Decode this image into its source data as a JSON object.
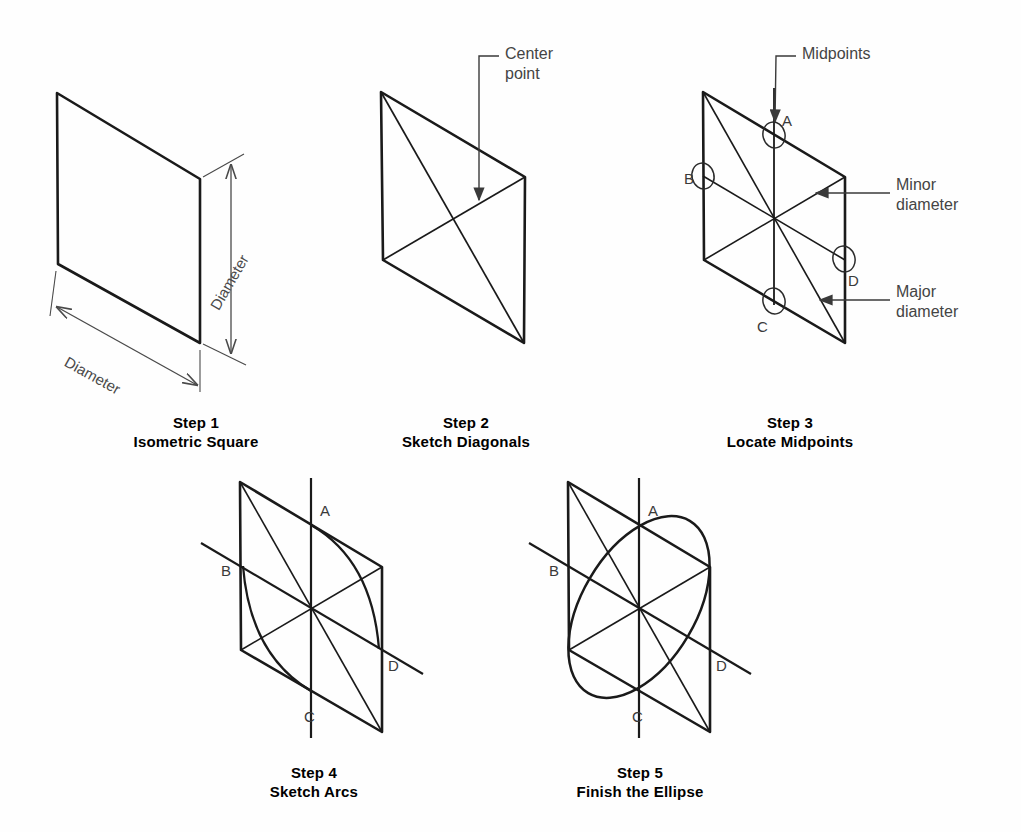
{
  "figure": {
    "background_color": "#fefefe",
    "ink_color": "#1a1a1a",
    "annotation_color": "#444444"
  },
  "steps": [
    {
      "id": "step-1",
      "number_label": "Step 1",
      "title": "Isometric Square",
      "caption_x": 196,
      "caption_y": 413,
      "rhombus": {
        "top_x": 57,
        "top_y": 93,
        "right_x": 200,
        "right_y": 179,
        "bottom_x": 200,
        "bottom_y": 343,
        "left_x": 58,
        "left_y": 264
      },
      "dimensions": [
        {
          "name": "vertical",
          "label": "Diameter",
          "label_x": 214,
          "label_y": 300,
          "rotation": -60
        },
        {
          "name": "horizontal",
          "label": "Diameter",
          "label_x": 66,
          "label_y": 352,
          "rotation": 29
        }
      ]
    },
    {
      "id": "step-2",
      "number_label": "Step 2",
      "title": "Sketch Diagonals",
      "caption_x": 466,
      "caption_y": 413,
      "rhombus": {
        "top_x": 381,
        "top_y": 92,
        "right_x": 525,
        "right_y": 177,
        "bottom_x": 524,
        "bottom_y": 343,
        "left_x": 383,
        "left_y": 260
      },
      "annotation": {
        "label_line1": "Center",
        "label_line2": "point",
        "text_x": 505,
        "text_y": 52
      }
    },
    {
      "id": "step-3",
      "number_label": "Step 3",
      "title": "Locate Midpoints",
      "caption_x": 790,
      "caption_y": 413,
      "rhombus": {
        "top_x": 703,
        "top_y": 92,
        "right_x": 845,
        "right_y": 177,
        "bottom_x": 845,
        "bottom_y": 343,
        "left_x": 704,
        "left_y": 260
      },
      "midpoint_labels": [
        {
          "name": "A",
          "text": "A",
          "x": 780,
          "y": 112
        },
        {
          "name": "B",
          "text": "B",
          "x": 685,
          "y": 178
        },
        {
          "name": "C",
          "text": "C",
          "x": 755,
          "y": 330
        },
        {
          "name": "D",
          "text": "D",
          "x": 849,
          "y": 278
        }
      ],
      "annotations": [
        {
          "name": "midpoints",
          "label_line1": "Midpoints",
          "label_line2": "",
          "text_x": 802,
          "text_y": 52
        },
        {
          "name": "minor-diameter",
          "label_line1": "Minor",
          "label_line2": "diameter",
          "text_x": 896,
          "text_y": 183
        },
        {
          "name": "major-diameter",
          "label_line1": "Major",
          "label_line2": "diameter",
          "text_x": 896,
          "text_y": 290
        }
      ]
    },
    {
      "id": "step-4",
      "number_label": "Step 4",
      "title": "Sketch Arcs",
      "caption_x": 314,
      "caption_y": 763,
      "rhombus": {
        "top_x": 240,
        "top_y": 482,
        "right_x": 382,
        "right_y": 567,
        "bottom_x": 382,
        "bottom_y": 732,
        "left_x": 241,
        "left_y": 650
      },
      "midpoint_labels": [
        {
          "name": "A",
          "text": "A",
          "x": 320,
          "y": 502
        },
        {
          "name": "B",
          "text": "B",
          "x": 222,
          "y": 568
        },
        {
          "name": "C",
          "text": "C",
          "x": 304,
          "y": 716
        },
        {
          "name": "D",
          "text": "D",
          "x": 386,
          "y": 665
        }
      ]
    },
    {
      "id": "step-5",
      "number_label": "Step 5",
      "title": "Finish the Ellipse",
      "caption_x": 640,
      "caption_y": 763,
      "rhombus": {
        "top_x": 568,
        "top_y": 482,
        "right_x": 710,
        "right_y": 567,
        "bottom_x": 710,
        "bottom_y": 732,
        "left_x": 569,
        "left_y": 650
      },
      "midpoint_labels": [
        {
          "name": "A",
          "text": "A",
          "x": 648,
          "y": 502
        },
        {
          "name": "B",
          "text": "B",
          "x": 550,
          "y": 568
        },
        {
          "name": "C",
          "text": "C",
          "x": 632,
          "y": 716
        },
        {
          "name": "D",
          "text": "D",
          "x": 714,
          "y": 665
        }
      ]
    }
  ]
}
